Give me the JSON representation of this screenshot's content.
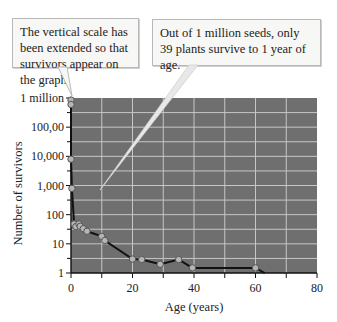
{
  "callouts": [
    {
      "text": "The vertical scale has been extended so that survivors appear on the graph."
    },
    {
      "text": "Out of 1 million seeds, only 39 plants survive to 1 year of age."
    }
  ],
  "colors": {
    "plot_background": "#6f6f6f",
    "gridline": "#d6d6d6",
    "line": "#111111",
    "marker_fill": "#b5b5b5",
    "marker_stroke": "#555555",
    "callout_fill": "#f7f7f5",
    "callout_border": "#b8b8b8"
  },
  "chart_data": {
    "type": "line",
    "title": "",
    "xlabel": "Age (years)",
    "ylabel": "Number of survivors",
    "x_scale": "linear",
    "y_scale": "log",
    "xlim": [
      0,
      80
    ],
    "ylim": [
      1,
      1000000
    ],
    "x_ticks": [
      0,
      20,
      40,
      60,
      80
    ],
    "x_minor_ticks": [
      10,
      30,
      50,
      70
    ],
    "y_ticks": [
      {
        "value": 1000000,
        "label": "1 million"
      },
      {
        "value": 100000,
        "label": "100,00"
      },
      {
        "value": 10000,
        "label": "10,000"
      },
      {
        "value": 1000,
        "label": "1,000"
      },
      {
        "value": 100,
        "label": "100"
      },
      {
        "value": 10,
        "label": "10"
      },
      {
        "value": 1,
        "label": "1"
      }
    ],
    "grid": true,
    "legend": null,
    "series": [
      {
        "name": "Survivors",
        "x": [
          0,
          0,
          0,
          0,
          0.3,
          1,
          1.6,
          2.6,
          3,
          4,
          5.2,
          10,
          11,
          20,
          23,
          29,
          35,
          39.5,
          60,
          63
        ],
        "y": [
          1000000,
          850000,
          600000,
          8000,
          800,
          48,
          39,
          48,
          40,
          33,
          27,
          18,
          13,
          3,
          2.9,
          2,
          2.9,
          1.5,
          1.5,
          1
        ],
        "markers": [
          false,
          true,
          true,
          true,
          true,
          true,
          true,
          true,
          true,
          true,
          true,
          true,
          true,
          true,
          true,
          true,
          true,
          true,
          true,
          false
        ]
      }
    ],
    "annotations": [
      {
        "text": "The vertical scale has been extended so that survivors appear on the graph.",
        "points_to": {
          "x": 0,
          "y": 1000000
        }
      },
      {
        "text": "Out of 1 million seeds, only 39 plants survive to 1 year of age.",
        "points_to": {
          "x": 1,
          "y": 39
        }
      }
    ]
  }
}
